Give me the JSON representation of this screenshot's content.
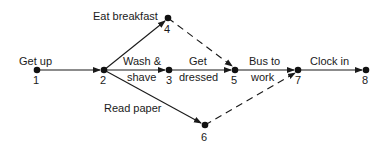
{
  "diagram": {
    "type": "activity-network",
    "nodes": [
      {
        "id": "1",
        "label": "1",
        "x": 37,
        "y": 70
      },
      {
        "id": "2",
        "label": "2",
        "x": 104,
        "y": 70
      },
      {
        "id": "3",
        "label": "3",
        "x": 169,
        "y": 70
      },
      {
        "id": "4",
        "label": "4",
        "x": 168,
        "y": 18
      },
      {
        "id": "5",
        "label": "5",
        "x": 235,
        "y": 70
      },
      {
        "id": "6",
        "label": "6",
        "x": 205,
        "y": 125
      },
      {
        "id": "7",
        "label": "7",
        "x": 298,
        "y": 70
      },
      {
        "id": "8",
        "label": "8",
        "x": 366,
        "y": 70
      }
    ],
    "activities": [
      {
        "from": "1",
        "to": "2",
        "label": "Get up",
        "dashed": false
      },
      {
        "from": "2",
        "to": "4",
        "label": "Eat breakfast",
        "dashed": false
      },
      {
        "from": "2",
        "to": "3",
        "label_line1": "Wash &",
        "label_line2": "shave",
        "dashed": false
      },
      {
        "from": "2",
        "to": "6",
        "label": "Read paper",
        "dashed": false
      },
      {
        "from": "3",
        "to": "5",
        "label_line1": "Get",
        "label_line2": "dressed",
        "dashed": false
      },
      {
        "from": "4",
        "to": "5",
        "label": "",
        "dashed": true
      },
      {
        "from": "5",
        "to": "7",
        "label_line1": "Bus to",
        "label_line2": "work",
        "dashed": false
      },
      {
        "from": "6",
        "to": "7",
        "label": "",
        "dashed": true
      },
      {
        "from": "7",
        "to": "8",
        "label": "Clock in",
        "dashed": false
      }
    ]
  }
}
